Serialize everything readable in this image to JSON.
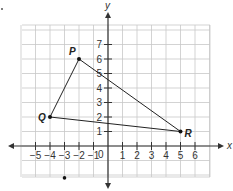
{
  "diagram": {
    "type": "coordinate-plane",
    "axes": {
      "x_label": "x",
      "y_label": "y",
      "origin_label": "0"
    },
    "x_ticks": [
      "-5",
      "-4",
      "-3",
      "-2",
      "-1",
      "1",
      "2",
      "3",
      "4",
      "5",
      "6"
    ],
    "y_ticks": [
      "1",
      "2",
      "3",
      "4",
      "5",
      "6",
      "7"
    ],
    "points": [
      {
        "label": "P",
        "x": -2,
        "y": 6
      },
      {
        "label": "Q",
        "x": -4,
        "y": 2
      },
      {
        "label": "R",
        "x": 5,
        "y": 1
      }
    ],
    "stray_dot": {
      "x": -3,
      "y": -2.2
    },
    "colors": {
      "grid": "#c8c8c8",
      "axis": "#333333",
      "shape": "#222222"
    }
  }
}
